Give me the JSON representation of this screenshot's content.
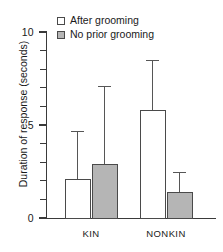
{
  "chart_data": {
    "type": "bar",
    "title": "",
    "xlabel": "",
    "ylabel": "Duration of response (seconds)",
    "categories": [
      "KIN",
      "NONKIN"
    ],
    "ylim": [
      0,
      10
    ],
    "ytick_labels": [
      "0",
      "5",
      "10"
    ],
    "ytick_values": [
      0,
      5,
      10
    ],
    "yminor_step": 1,
    "grid": false,
    "legend_position": "top-left",
    "series": [
      {
        "name": "After grooming",
        "style": "open",
        "color": "#ffffff",
        "edge_color": "#4a4a4a",
        "values": [
          2.1,
          5.8
        ],
        "errors_upper": [
          4.7,
          8.5
        ]
      },
      {
        "name": "No prior grooming",
        "style": "filled",
        "color": "#b5b5b5",
        "edge_color": "#4a4a4a",
        "values": [
          2.9,
          1.4
        ],
        "errors_upper": [
          7.1,
          2.5
        ]
      }
    ]
  },
  "axis": {
    "y_title": "Duration of response (seconds)",
    "ticks": [
      {
        "label": "10",
        "value": 10,
        "major": true
      },
      {
        "label": "",
        "value": 9,
        "major": false
      },
      {
        "label": "",
        "value": 8,
        "major": false
      },
      {
        "label": "",
        "value": 7,
        "major": false
      },
      {
        "label": "",
        "value": 6,
        "major": false
      },
      {
        "label": "5",
        "value": 5,
        "major": true
      },
      {
        "label": "",
        "value": 4,
        "major": false
      },
      {
        "label": "",
        "value": 3,
        "major": false
      },
      {
        "label": "",
        "value": 2,
        "major": false
      },
      {
        "label": "",
        "value": 1,
        "major": false
      },
      {
        "label": "0",
        "value": 0,
        "major": true
      }
    ],
    "group_labels": [
      "KIN",
      "NONKIN"
    ]
  },
  "legend": {
    "items": [
      {
        "label": "After grooming",
        "style": "open"
      },
      {
        "label": "No prior grooming",
        "style": "filled"
      }
    ]
  }
}
